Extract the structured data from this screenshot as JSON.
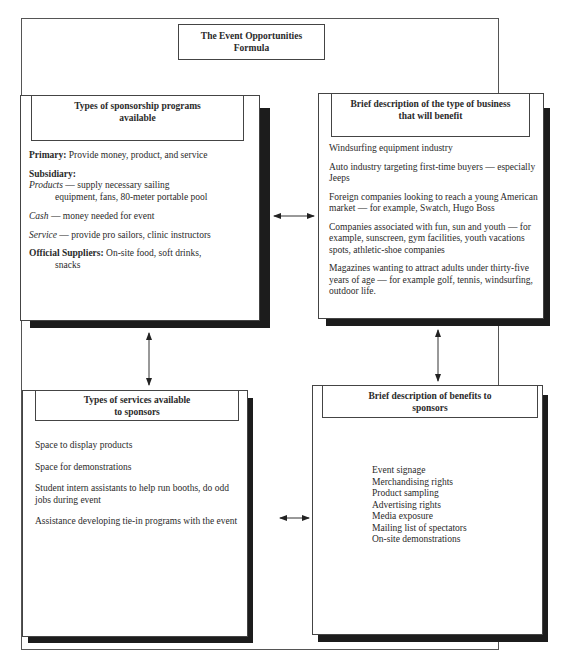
{
  "diagram": {
    "title_line1": "The Event Opportunities",
    "title_line2": "Formula",
    "colors": {
      "line": "#444444",
      "shadow": "#1c1c1c",
      "text": "#2a2a2a"
    },
    "sponsorship_programs": {
      "heading_line1": "Types of sponsorship programs",
      "heading_line2": "available",
      "primary_label": "Primary:",
      "primary_text": " Provide money, product, and service",
      "subsidiary_label": "Subsidiary:",
      "products_label": "Products",
      "products_text": " — supply necessary sailing",
      "products_text2": "equipment, fans, 80-meter portable pool",
      "cash_label": "Cash",
      "cash_text": " — money needed for event",
      "service_label": "Service",
      "service_text": " — provide pro sailors, clinic instructors",
      "official_label": "Official Suppliers:",
      "official_text": " On-site food, soft drinks,",
      "official_text2": "snacks"
    },
    "business_types": {
      "heading_line1": "Brief description of the type of business",
      "heading_line2": "that will benefit",
      "items": [
        "Windsurfing equipment industry",
        "Auto industry targeting first-time buyers — especially Jeeps",
        "Foreign companies looking to reach a young American market — for example, Swatch, Hugo Boss",
        "Companies associated with fun, sun and youth — for example,  sunscreen, gym facilities, youth vacations spots, athletic-shoe companies",
        "Magazines wanting to attract adults under thirty-five years of age — for example golf, tennis, windsurfing, outdoor life."
      ]
    },
    "services": {
      "heading_line1": "Types of services available",
      "heading_line2": "to sponsors",
      "items": [
        "Space to display products",
        "Space for demonstrations",
        "Student intern assistants to help run booths, do odd jobs during event",
        "Assistance developing tie-in programs with the event"
      ]
    },
    "benefits": {
      "heading_line1": "Brief description of benefits to",
      "heading_line2": "sponsors",
      "items": [
        "Event signage",
        "Merchandising rights",
        "Product sampling",
        "Advertising rights",
        "Media exposure",
        "Mailing list of spectators",
        "On-site demonstrations"
      ]
    }
  }
}
